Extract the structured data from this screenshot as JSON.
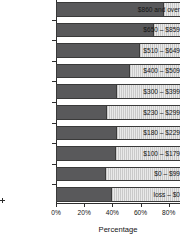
{
  "chart_data": {
    "type": "bar",
    "orientation": "horizontal",
    "stacked": true,
    "title": "",
    "xlabel": "Percentage",
    "ylabel": "",
    "xlim": [
      0,
      88
    ],
    "xticks": [
      "0%",
      "20%",
      "40%",
      "60%",
      "80%"
    ],
    "xtick_values": [
      0,
      20,
      40,
      60,
      80
    ],
    "grid": false,
    "legend": "none",
    "categories": [
      "$860 and over",
      "$650 – $859",
      "$510 – $649",
      "$400 – $509",
      "$300 – $399",
      "$230 – $299",
      "$180 – $229",
      "$100 – $179",
      "$0 – $99",
      "loss – $0"
    ],
    "series": [
      {
        "name": "dark-segment",
        "color": "#59595b",
        "values": [
          75,
          68,
          58,
          51,
          42,
          35,
          42,
          41,
          34,
          38
        ]
      },
      {
        "name": "light-hatched-segment",
        "color": "#d9d9d9",
        "values": [
          13,
          20,
          30,
          37,
          46,
          53,
          46,
          47,
          54,
          50
        ]
      }
    ],
    "bar_total": 88
  },
  "colors": {
    "dark": "#59595b",
    "light": "#d9d9d9",
    "outline": "#3a3a3a",
    "axis": "#2d2d2d",
    "background": "#ffffff"
  }
}
